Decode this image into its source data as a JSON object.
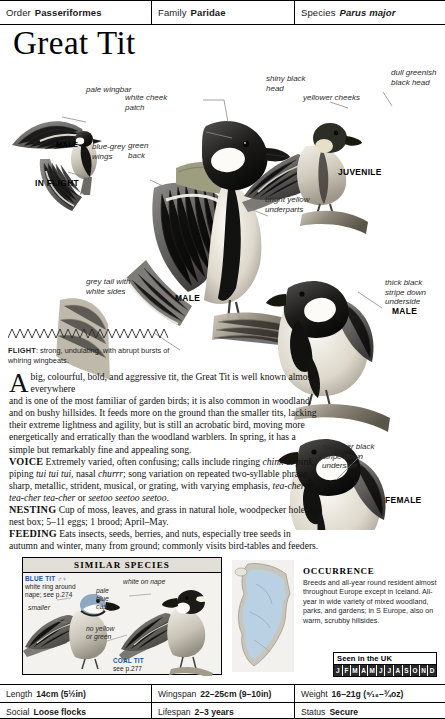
{
  "taxonomy": {
    "order_label": "Order",
    "order_value": "Passeriformes",
    "family_label": "Family",
    "family_value": "Paridae",
    "species_label": "Species",
    "species_value": "Parus major"
  },
  "title": "Great Tit",
  "callouts": {
    "pale_wingbar": "pale wingbar",
    "blue_grey_wings": "blue-grey\nwings",
    "white_cheek_patch": "white cheek\npatch",
    "green_back": "green\nback",
    "shiny_black_head": "shiny black\nhead",
    "dull_greenish_black_head": "dull greenish\nblack head",
    "yellower_cheeks": "yellower cheeks",
    "bright_yellow_underparts": "bright yellow\nunderparts",
    "thick_black_stripe": "thick black\nstripe down\nunderside",
    "narrower_black_stripe": "narrower black\nstripe down\nunderside",
    "grey_tail_white_sides": "grey tail with\nwhite sides"
  },
  "plate_captions": {
    "male_flight": "MALE",
    "in_flight": "IN FLIGHT",
    "male_main": "MALE",
    "juvenile": "JUVENILE",
    "male_right": "MALE",
    "female": "FEMALE"
  },
  "flight": {
    "label": "FLIGHT",
    "text": ": strong, undulating, with abrupt bursts of whiring wingbeats."
  },
  "body": {
    "dropcap": "A",
    "lead": "big, colourful, bold, and aggressive tit, the\nGreat Tit is well known almost everywhere",
    "paragraph": "and is one of the most familiar of garden birds; it is also common in woodland and on bushy hillsides. It feeds more on the ground than the smaller tits, lacking their extreme lightness and agility, but is still an acrobatic bird, moving more energetically and erratically than the woodland warblers. In spring, it has a simple but remarkably fine and appealing song.",
    "voice_label": "VOICE",
    "voice_text_1": " Extremely varied, often confusing; calls include ringing ",
    "voice_ital_1": "chink",
    "voice_text_2": " or ",
    "voice_ital_2": "pink",
    "voice_text_3": ", piping ",
    "voice_ital_3": "tui tui tui",
    "voice_text_4": ", nasal ",
    "voice_ital_4": "churrr",
    "voice_text_5": "; song variation on repeated two-syllable phrase, sharp, metallic, strident, musical, or grating, with varying emphasis, ",
    "voice_ital_5": "tea-cher tea-cher tea-cher",
    "voice_text_6": " or ",
    "voice_ital_6": "seetoo seetoo seetoo",
    "voice_text_7": ".",
    "nesting_label": "NESTING",
    "nesting_text": " Cup of moss, leaves, and grass in natural hole, woodpecker hole, or nest box; 5–11 eggs; 1 brood; April–May.",
    "feeding_label": "FEEDING",
    "feeding_text": " Eats insects, seeds, berries, and nuts, especially tree seeds in autumn and winter, many from ground; commonly visits bird-tables and feeders."
  },
  "similar_species": {
    "heading": "SIMILAR SPECIES",
    "blue_tit": {
      "name": "BLUE TIT ♂♀",
      "note": "white ring around\nnape; see p.274",
      "callout_smaller": "smaller",
      "callout_cap": "pale\nblue\ncap"
    },
    "coal_tit": {
      "name": "COAL TIT",
      "note": "see p.277",
      "callout_nape": "white on nape",
      "callout_colour": "no yellow\nor green"
    }
  },
  "occurrence": {
    "title": "OCCURRENCE",
    "text": "Breeds and all-year round resident almost throughout Europe except in Iceland. All-year in wide variety of mixed woodland, parks, and gardens; in S Europe, also on warm, scrubby hillsides.",
    "uk_label": "Seen in the UK",
    "months": [
      "J",
      "F",
      "M",
      "A",
      "M",
      "J",
      "J",
      "A",
      "S",
      "O",
      "N",
      "D"
    ],
    "months_seen": [
      true,
      true,
      true,
      true,
      true,
      true,
      true,
      true,
      true,
      true,
      true,
      true
    ]
  },
  "stats": {
    "length_label": "Length",
    "length_value": "14cm (5½in)",
    "wingspan_label": "Wingspan",
    "wingspan_value": "22–25cm (9–10in)",
    "weight_label": "Weight",
    "weight_value": "16–21g (⁹⁄₁₆–¾oz)",
    "social_label": "Social",
    "social_value": "Loose flocks",
    "lifespan_label": "Lifespan",
    "lifespan_value": "2–3 years",
    "status_label": "Status",
    "status_value": "Secure"
  },
  "colors": {
    "accent_blue": "#1a54a8",
    "rule": "#000000",
    "panel_bg": "#f4f2ef",
    "map_land": "#d8d5cd",
    "map_range": "#b9d4ea"
  }
}
